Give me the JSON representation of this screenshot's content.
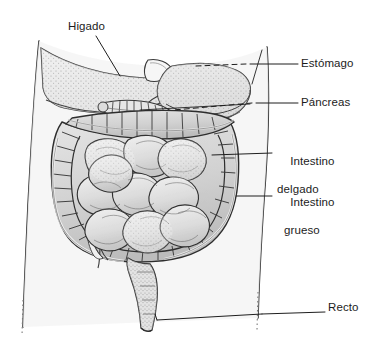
{
  "figure": {
    "background_color": "#ffffff",
    "ink_color": "#1c1c1c",
    "organ_fill": "#d9d9d9",
    "organ_fill_light": "#efefef",
    "body_fill": "#f2f2f2",
    "width": 377,
    "height": 345
  },
  "labels": {
    "higado": "Higado",
    "estomago": "Estómago",
    "pancreas": "Páncreas",
    "intestino_delgado_line1": "Intestino",
    "intestino_delgado_line2": "delgado",
    "intestino_grueso_line1": "Intestino",
    "intestino_grueso_line2": "grueso",
    "recto": "Recto"
  },
  "organs": [
    {
      "id": "higado",
      "label": "Higado",
      "side": "left",
      "description": "Liver, stippled shading, upper left of abdomen"
    },
    {
      "id": "estomago",
      "label": "Estómago",
      "side": "right",
      "description": "Stomach, shaded mass behind liver, upper abdomen"
    },
    {
      "id": "pancreas",
      "label": "Páncreas",
      "side": "right",
      "description": "Pancreas, segmented tube below stomach"
    },
    {
      "id": "intestino_delgado",
      "label": "Intestino delgado",
      "side": "right",
      "description": "Small intestine, coiled loops filling central abdomen"
    },
    {
      "id": "intestino_grueso",
      "label": "Intestino grueso",
      "side": "right",
      "description": "Large intestine, haustrated frame around small intestine"
    },
    {
      "id": "recto",
      "label": "Recto",
      "side": "right",
      "description": "Rectum, descending tube at lower midline"
    }
  ],
  "leader_lines": [
    {
      "organ": "higado",
      "from": [
        96,
        36
      ],
      "to": [
        120,
        76
      ]
    },
    {
      "organ": "estomago",
      "from": [
        296,
        64
      ],
      "to": [
        190,
        68
      ]
    },
    {
      "organ": "pancreas",
      "from": [
        296,
        103
      ],
      "to": [
        140,
        110
      ]
    },
    {
      "organ": "intestino_delgado",
      "from": [
        272,
        153
      ],
      "to": [
        212,
        155
      ]
    },
    {
      "organ": "intestino_grueso",
      "from": [
        272,
        196
      ],
      "to": [
        236,
        196
      ]
    },
    {
      "organ": "recto",
      "from": [
        324,
        312
      ],
      "to": [
        157,
        320
      ]
    }
  ]
}
